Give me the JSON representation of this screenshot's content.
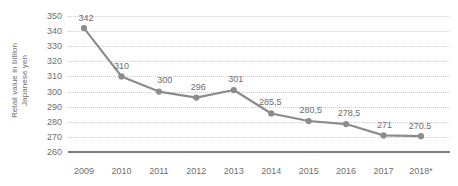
{
  "chart_data": {
    "type": "line",
    "title": "",
    "subtitle": "",
    "xlabel": "",
    "ylabel": "Retail value in billion Japanese yen",
    "ylabel_line1": "Retail value in billion",
    "ylabel_line2": "Japanese yen",
    "categories": [
      "2009",
      "2010",
      "2011",
      "2012",
      "2013",
      "2014",
      "2015",
      "2016",
      "2017",
      "2018*"
    ],
    "values": [
      342,
      310,
      300,
      296,
      301,
      285.5,
      280.5,
      278.5,
      271,
      270.5
    ],
    "point_labels": [
      "342",
      "310",
      "300",
      "296",
      "301",
      "285,5",
      "280,5",
      "278,5",
      "271",
      "270.5"
    ],
    "ylim": [
      260,
      350
    ],
    "yticks": [
      350,
      340,
      330,
      320,
      310,
      300,
      290,
      280,
      270,
      260
    ],
    "ytick_labels": [
      "350",
      "340",
      "330",
      "320",
      "310",
      "300",
      "290",
      "280",
      "270",
      "260"
    ],
    "grid": true,
    "grid_style": "dotted",
    "legend": "none",
    "series": [
      {
        "name": "Retail value",
        "values": [
          342,
          310,
          300,
          296,
          301,
          285.5,
          280.5,
          278.5,
          271,
          270.5
        ]
      }
    ],
    "colors": {
      "line": "#8c8c8c",
      "marker": "#8c8c8c",
      "grid": "#cfcfcf",
      "axis": "#7f7f7f",
      "text": "#6e6e6e",
      "background": "#ffffff"
    },
    "footnote_marker": "*"
  }
}
